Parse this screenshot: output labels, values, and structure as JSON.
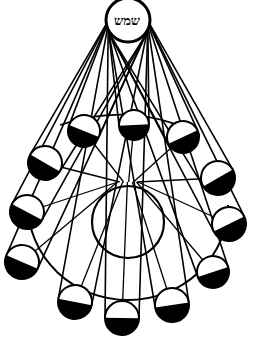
{
  "diagram": {
    "title": "",
    "sun": {
      "label": "שמש",
      "cx": 128,
      "cy": 20,
      "r": 22
    },
    "earth": {
      "cx": 128,
      "cy": 222,
      "r": 36
    },
    "orbit_ellipse": {
      "cx": 128,
      "cy": 225,
      "rx": 100,
      "ry": 95
    },
    "moons": [
      {
        "id": "moon-top",
        "cx": 134,
        "cy": 125,
        "r": 15
      },
      {
        "id": "moon-upper-left",
        "cx": 84,
        "cy": 131,
        "r": 16
      },
      {
        "id": "moon-upper-right",
        "cx": 183,
        "cy": 137,
        "r": 16
      },
      {
        "id": "moon-left-1",
        "cx": 45,
        "cy": 163,
        "r": 17
      },
      {
        "id": "moon-left-2",
        "cx": 27,
        "cy": 212,
        "r": 17
      },
      {
        "id": "moon-left-3",
        "cx": 22,
        "cy": 262,
        "r": 17
      },
      {
        "id": "moon-right-1",
        "cx": 218,
        "cy": 178,
        "r": 17
      },
      {
        "id": "moon-right-2",
        "cx": 229,
        "cy": 224,
        "r": 17
      },
      {
        "id": "moon-right-3",
        "cx": 213,
        "cy": 272,
        "r": 16
      },
      {
        "id": "moon-bottom-left",
        "cx": 75,
        "cy": 302,
        "r": 17
      },
      {
        "id": "moon-bottom",
        "cx": 122,
        "cy": 318,
        "r": 17
      },
      {
        "id": "moon-bottom-right",
        "cx": 172,
        "cy": 305,
        "r": 17
      }
    ],
    "colors": {
      "ink": "#000000",
      "paper": "#ffffff"
    }
  }
}
